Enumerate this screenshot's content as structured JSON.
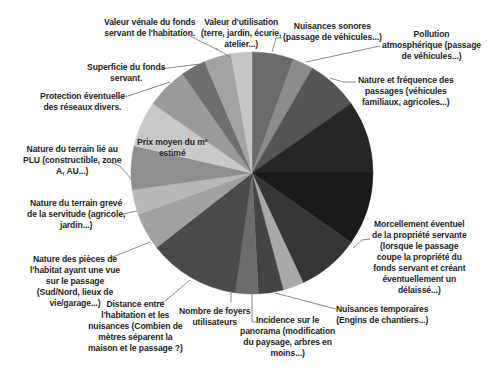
{
  "chart_data": {
    "type": "pie",
    "title": "",
    "center": [
      252,
      173
    ],
    "radius": 121,
    "start_angle_deg": 0,
    "direction": "clockwise",
    "legend": "none (leader-line labels)",
    "slices": [
      {
        "label": "Nuisances sonores (passage de véhicules...)",
        "value": 20,
        "color": "#6b6b6b"
      },
      {
        "label": "Pollution atmosphérique (passage de véhicules...)",
        "value": 10,
        "color": "#8c8c8c"
      },
      {
        "label": "Nature et fréquence des passages (véhicules familiaux, agricoles...)",
        "value": 25,
        "color": "#545454"
      },
      {
        "label": "(illegible label)",
        "value": 35,
        "color": "#262626"
      },
      {
        "label": "Morcellement éventuel de la propriété servante (lorsque le passage coupe la propriété du fonds servant et créant éventuellement un délaissé...)",
        "value": 35,
        "color": "#1b1b1b"
      },
      {
        "label": "(unlabeled)",
        "value": 30,
        "color": "#363636"
      },
      {
        "label": "Nuisances temporaires (Engins de chantiers...)",
        "value": 10,
        "color": "#a9a9a9"
      },
      {
        "label": "Incidence sur le panorama (modification du paysage, arbres en moins...)",
        "value": 12,
        "color": "#444444"
      },
      {
        "label": "Nombre de foyers utilisateurs",
        "value": 11,
        "color": "#6c6c6c"
      },
      {
        "label": "Distance entre l'habitation et les nuisances (Combien de mètres séparent la maison et le passage ?)",
        "value": 44,
        "color": "#4b4b4b"
      },
      {
        "label": "Nature des pièces de l'habitat ayant une vue sur le passage (Sud/Nord, lieux de vie/garage...)",
        "value": 18,
        "color": "#a1a1a1"
      },
      {
        "label": "Nature du terrain grevé de la servitude (agricole, jardin...)",
        "value": 12,
        "color": "#b7b7b7"
      },
      {
        "label": "Nature du terrain lié au PLU (constructible, zone A, AU...)",
        "value": 21,
        "color": "#8f8f8f"
      },
      {
        "label": "Prix moyen du m² estimé",
        "value": 22,
        "color": "#c9c9c9"
      },
      {
        "label": "Protection éventuelle des réseaux divers.",
        "value": 20,
        "color": "#9b9b9b"
      },
      {
        "label": "Superficie du fonds servant.",
        "value": 12,
        "color": "#6f6f6f"
      },
      {
        "label": "Valeur vénale du fonds servant de l'habitation.",
        "value": 13,
        "color": "#a3a3a3"
      },
      {
        "label": "Valeur d'utilisation (terre, jardin, écurie, atelier...)",
        "value": 10,
        "color": "#c5c5c5"
      }
    ]
  },
  "labels": {
    "valeur_venale": [
      "Valeur vénale du fonds",
      "servant de l'habitation."
    ],
    "valeur_utilisation": [
      "Valeur d'utilisation",
      "(terre, jardin, écurie,",
      "atelier...)"
    ],
    "nuisances_sonores": [
      "Nuisances sonores",
      "(passage de véhicules...)"
    ],
    "pollution": [
      "Pollution",
      "atmosphérique (passage",
      "de véhicules...)"
    ],
    "superficie": [
      "Superficie du fonds",
      "servant."
    ],
    "protection": [
      "Protection éventuelle",
      "des réseaux divers."
    ],
    "nature_frequence": [
      "Nature et fréquence des",
      "passages (véhicules",
      "familiaux, agricoles...)"
    ],
    "prix_moyen": [
      "Prix moyen du m²",
      "estimé"
    ],
    "plu": [
      "Nature du terrain lié au",
      "PLU (constructible, zone",
      "A, AU...)"
    ],
    "terrain_greve": [
      "Nature du terrain grevé",
      "de la servitude (agricole,",
      "jardin...)"
    ],
    "morcellement": [
      "Morcellement éventuel",
      "de la propriété servante",
      "(lorsque le passage",
      "coupe la propriété du",
      "fonds servant et créant",
      "éventuellement un",
      "délaissé...)"
    ],
    "pieces": [
      "Nature des pièces de",
      "l'habitat ayant une vue",
      "sur le passage",
      "(Sud/Nord, lieux de",
      "vie/garage...)"
    ],
    "distance": [
      "Distance entre",
      "l'habitation et les",
      "nuisances (Combien de",
      "mètres séparent la",
      "maison et le passage ?)"
    ],
    "foyers": [
      "Nombre de foyers",
      "utilisateurs"
    ],
    "panorama": [
      "Incidence sur le",
      "panorama (modification",
      "du paysage, arbres en",
      "moins...)"
    ],
    "temporaires": [
      "Nuisances temporaires",
      "(Engins de chantiers...)"
    ]
  }
}
